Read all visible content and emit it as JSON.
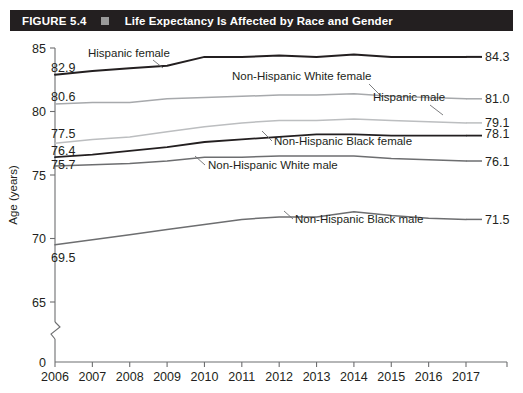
{
  "header": {
    "figure_number": "FIGURE 5.4",
    "square_icon": "title-square-icon",
    "title": "Life Expectancy Is Affected by Race and Gender",
    "bar_color": "#231f20",
    "square_color": "#9a9a9a",
    "text_color": "#ffffff"
  },
  "chart_data": {
    "type": "line",
    "title": "Life Expectancy Is Affected by Race and Gender",
    "xlabel": "",
    "ylabel": "Age (years)",
    "x": [
      2006,
      2007,
      2008,
      2009,
      2010,
      2011,
      2012,
      2013,
      2014,
      2015,
      2016,
      2017
    ],
    "categories": [
      "2006",
      "2007",
      "2008",
      "2009",
      "2010",
      "2011",
      "2012",
      "2013",
      "2014",
      "2015",
      "2016",
      "2017"
    ],
    "ytick_labels": [
      "0",
      "65",
      "70",
      "75",
      "80",
      "85"
    ],
    "yticks": [
      0,
      65,
      70,
      75,
      80,
      85
    ],
    "ylim": [
      63.5,
      85
    ],
    "axis_break": true,
    "grid": false,
    "legend": "inline-labels",
    "series": [
      {
        "name": "Hispanic female",
        "label": "Hispanic female",
        "color": "#231f20",
        "width": 2.0,
        "start_value": "82.9",
        "end_value": "84.3",
        "values": [
          82.9,
          83.2,
          83.4,
          83.6,
          84.3,
          84.3,
          84.4,
          84.3,
          84.5,
          84.3,
          84.3,
          84.3
        ]
      },
      {
        "name": "Non-Hispanic White female",
        "label": "Non-Hispanic White female",
        "color": "#a7a9ac",
        "width": 1.5,
        "start_value": "80.6",
        "end_value": "81.0",
        "values": [
          80.6,
          80.7,
          80.7,
          81.0,
          81.1,
          81.2,
          81.3,
          81.3,
          81.4,
          81.2,
          81.1,
          81.0
        ]
      },
      {
        "name": "Hispanic male",
        "label": "Hispanic male",
        "color": "#bcbec0",
        "width": 1.5,
        "start_value": "77.5",
        "end_value": "79.1",
        "values": [
          77.5,
          77.8,
          78.0,
          78.4,
          78.8,
          79.1,
          79.3,
          79.3,
          79.4,
          79.3,
          79.2,
          79.1
        ]
      },
      {
        "name": "Non-Hispanic Black female",
        "label": "Non-Hispanic Black female",
        "color": "#231f20",
        "width": 1.8,
        "start_value": "76.4",
        "end_value": "78.1",
        "values": [
          76.4,
          76.6,
          76.9,
          77.2,
          77.6,
          77.8,
          78.0,
          78.2,
          78.2,
          78.1,
          78.1,
          78.1
        ]
      },
      {
        "name": "Non-Hispanic White male",
        "label": "Non-Hispanic White male",
        "color": "#6d6e70",
        "width": 1.5,
        "start_value": "75.7",
        "end_value": "76.1",
        "values": [
          75.7,
          75.8,
          75.9,
          76.1,
          76.4,
          76.4,
          76.5,
          76.5,
          76.5,
          76.3,
          76.2,
          76.1
        ]
      },
      {
        "name": "Non-Hispanic Black male",
        "label": "Non-Hispanic Black male",
        "color": "#6d6e70",
        "width": 1.5,
        "start_value": "69.5",
        "end_value": "71.5",
        "values": [
          69.5,
          69.9,
          70.3,
          70.7,
          71.1,
          71.5,
          71.7,
          71.7,
          72.1,
          71.8,
          71.6,
          71.5
        ]
      }
    ],
    "annotations": [
      {
        "text": "Hispanic female",
        "series": "Hispanic female"
      },
      {
        "text": "Non-Hispanic White female",
        "series": "Non-Hispanic White female"
      },
      {
        "text": "Hispanic male",
        "series": "Hispanic male"
      },
      {
        "text": "Non-Hispanic Black female",
        "series": "Non-Hispanic Black female"
      },
      {
        "text": "Non-Hispanic White male",
        "series": "Non-Hispanic White male"
      },
      {
        "text": "Non-Hispanic Black male",
        "series": "Non-Hispanic Black male"
      }
    ]
  }
}
